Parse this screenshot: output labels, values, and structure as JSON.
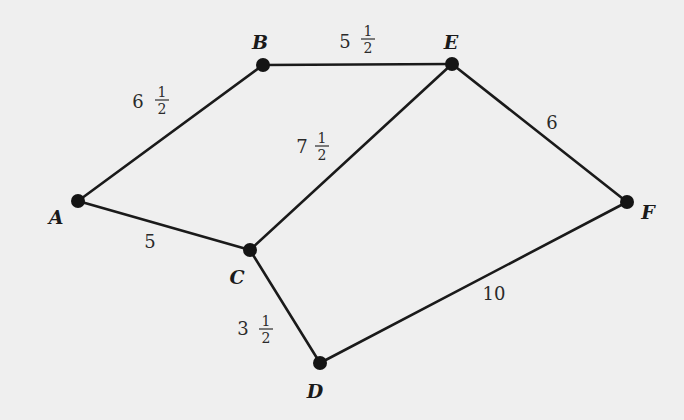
{
  "diagram": {
    "type": "weighted-undirected-graph",
    "colors": {
      "background": "#efefef",
      "edge": "#1a1a1a",
      "node": "#141414",
      "text": "#1a1a1a"
    },
    "nodes": [
      {
        "id": "A",
        "label": "A",
        "x": 78,
        "y": 201,
        "lx": 56,
        "ly": 224
      },
      {
        "id": "B",
        "label": "B",
        "x": 263,
        "y": 65,
        "lx": 260,
        "ly": 49
      },
      {
        "id": "E",
        "label": "E",
        "x": 452,
        "y": 64,
        "lx": 451,
        "ly": 49
      },
      {
        "id": "F",
        "label": "F",
        "x": 627,
        "y": 202,
        "lx": 648,
        "ly": 219
      },
      {
        "id": "C",
        "label": "C",
        "x": 250,
        "y": 250,
        "lx": 237,
        "ly": 284
      },
      {
        "id": "D",
        "label": "D",
        "x": 320,
        "y": 363,
        "lx": 315,
        "ly": 398
      }
    ],
    "edges": [
      {
        "from": "A",
        "to": "B",
        "weight": "6 1/2",
        "whole": "6",
        "num": "1",
        "den": "2",
        "wx": 138,
        "wy": 108,
        "fx": 162,
        "fy": 100
      },
      {
        "from": "B",
        "to": "E",
        "weight": "5 1/2",
        "whole": "5",
        "num": "1",
        "den": "2",
        "wx": 345,
        "wy": 48,
        "fx": 368,
        "fy": 39
      },
      {
        "from": "C",
        "to": "E",
        "weight": "7 1/2",
        "whole": "7",
        "num": "1",
        "den": "2",
        "wx": 302,
        "wy": 153,
        "fx": 322,
        "fy": 146
      },
      {
        "from": "E",
        "to": "F",
        "weight": "6",
        "whole": "6",
        "wx": 552,
        "wy": 129
      },
      {
        "from": "A",
        "to": "C",
        "weight": "5",
        "whole": "5",
        "wx": 150,
        "wy": 248
      },
      {
        "from": "C",
        "to": "D",
        "weight": "3 1/2",
        "whole": "3",
        "num": "1",
        "den": "2",
        "wx": 243,
        "wy": 335,
        "fx": 266,
        "fy": 329
      },
      {
        "from": "D",
        "to": "F",
        "weight": "10",
        "whole": "10",
        "wx": 494,
        "wy": 300
      }
    ]
  }
}
